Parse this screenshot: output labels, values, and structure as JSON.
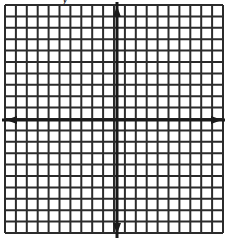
{
  "diagram": {
    "type": "coordinate-plane-grid",
    "axis_label_partial": "y",
    "grid": {
      "columns": 20,
      "rows": 20,
      "left": 5,
      "right": 223,
      "top": 5,
      "bottom": 233
    },
    "axes": {
      "x_axis_y": 120,
      "y_axis_x": 117,
      "arrows": [
        "up",
        "down",
        "left",
        "right"
      ]
    },
    "colors": {
      "grid_line": "#2b2b2b",
      "axis_line": "#1a1a1a",
      "background": "#ffffff"
    }
  }
}
